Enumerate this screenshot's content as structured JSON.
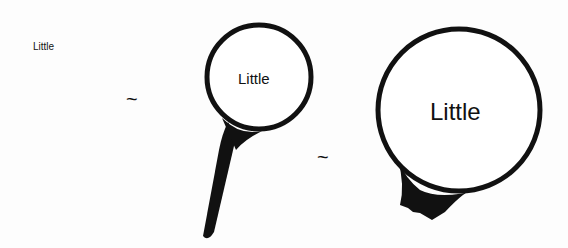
{
  "figure": {
    "original_text": "Little",
    "magnified_medium_text": "Little",
    "magnified_large_text": "Little",
    "relation_symbol_1": "~",
    "relation_symbol_2": "~"
  },
  "colors": {
    "ink": "#111111",
    "background": "#fdfdfd"
  }
}
